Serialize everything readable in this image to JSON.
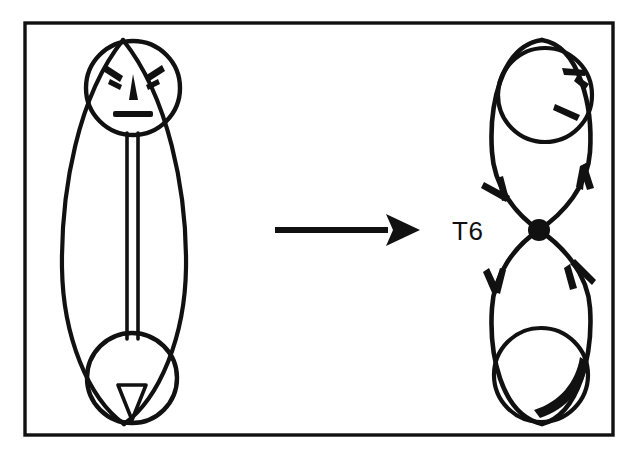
{
  "figure": {
    "background_color": "#ffffff",
    "ink_color": "#111111",
    "frame": {
      "name": "outer-border",
      "x": 25,
      "y": 23,
      "width": 588,
      "height": 412,
      "stroke_width": 3.4
    },
    "left_diagram": {
      "name": "lens-figure-with-face",
      "description": "Large vertical lens (pointed oval) containing a head circle at top with an angry face, a narrow vertical double-line shaft, and a small circle at the bottom containing a downward triangle",
      "outer_lens": {
        "center_x": 123,
        "top_y": 40,
        "bottom_y": 424,
        "half_width": 62
      },
      "head_circle": {
        "cx": 133,
        "cy": 88,
        "r": 47
      },
      "face": {
        "eyebrow_left": "angled-dash",
        "eyebrow_right": "angled-dash",
        "nose": "narrow-triangle",
        "mouth": "straight-bar",
        "expression": "angry"
      },
      "shaft": {
        "x_left": 127,
        "x_right": 137,
        "top_y": 133,
        "bottom_y": 337
      },
      "bottom_circle": {
        "cx": 132,
        "cy": 378,
        "r": 45
      },
      "bottom_triangle": {
        "apex_y": 418,
        "top_y": 385,
        "half_width": 14
      }
    },
    "arrow": {
      "name": "transformation-arrow",
      "direction": "right",
      "x_start": 275,
      "x_end": 420,
      "y": 230,
      "shaft_thickness": 5,
      "head_length": 34,
      "head_half_height": 16
    },
    "right_diagram": {
      "name": "figure-eight-flow-diagram",
      "description": "Two stacked lobes meeting at a solid crossing node; each lobe holds an inner circle with arrowhead tick marks; directed arrows run down the left and up the right",
      "node": {
        "cx": 539,
        "cy": 230,
        "r": 11
      },
      "top_lobe": {
        "outer_top_y": 40,
        "left_x": 492,
        "right_x": 592,
        "inner_circle": {
          "cx": 545,
          "cy": 95,
          "r": 47
        }
      },
      "bottom_lobe": {
        "outer_bottom_y": 424,
        "left_x": 492,
        "right_x": 592,
        "inner_circle": {
          "cx": 541,
          "cy": 375,
          "r": 47
        }
      },
      "arrowheads": [
        {
          "name": "top-left-descending-arrowhead",
          "x": 502,
          "y": 190,
          "direction": "down-right"
        },
        {
          "name": "top-right-ascending-arrowhead",
          "x": 586,
          "y": 178,
          "direction": "up"
        },
        {
          "name": "bottom-left-descending-arrowhead",
          "x": 498,
          "y": 278,
          "direction": "down"
        },
        {
          "name": "bottom-right-ascending-arrowhead",
          "x": 584,
          "y": 272,
          "direction": "up-left"
        },
        {
          "name": "top-inner-circle-tick-upper",
          "x": 578,
          "y": 72
        },
        {
          "name": "top-inner-circle-tick-lower",
          "x": 572,
          "y": 110
        },
        {
          "name": "bottom-inner-circle-tick",
          "x": 575,
          "y": 388
        }
      ],
      "label": {
        "name": "node-label",
        "text": "T6",
        "x": 452,
        "y": 240,
        "font_size": 26
      }
    }
  }
}
